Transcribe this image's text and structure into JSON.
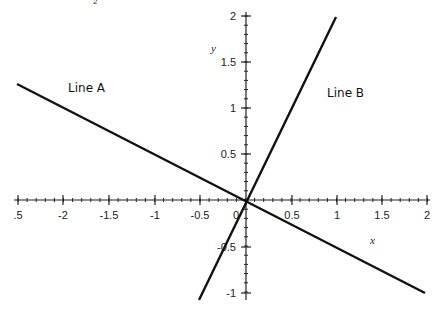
{
  "chart_data": {
    "type": "line",
    "title": "",
    "xlabel": "x",
    "ylabel": "y",
    "xlim": [
      -2.5,
      2
    ],
    "ylim": [
      -1,
      2
    ],
    "x_ticks": [
      "-2.5",
      "-2",
      "-1.5",
      "-1",
      "-0.5",
      "0",
      "0.5",
      "1",
      "1.5",
      "2"
    ],
    "y_ticks": [
      "-1",
      "-0.5",
      "0.5",
      "1",
      "1.5",
      "2"
    ],
    "grid": false,
    "legend": "none",
    "series": [
      {
        "name": "Line A",
        "equation": "y = -0.5x",
        "x": [
          -2.5,
          2
        ],
        "y": [
          1.25,
          -1
        ]
      },
      {
        "name": "Line B",
        "equation": "y = 2x",
        "x": [
          -0.5,
          1
        ],
        "y": [
          -1,
          2
        ]
      }
    ],
    "annotations": [
      "Line A",
      "Line B"
    ]
  },
  "labels": {
    "top_fragment": "2",
    "x_axis": "x",
    "y_axis": "y",
    "line_a": "Line A",
    "line_b": "Line B"
  },
  "ticks": {
    "x": [
      {
        "label": ".5",
        "px": 18
      },
      {
        "label": "-2",
        "px": 63
      },
      {
        "label": "-1.5",
        "px": 109
      },
      {
        "label": "-1",
        "px": 155
      },
      {
        "label": "-0.5",
        "px": 200
      },
      {
        "label": "0",
        "px": 236
      },
      {
        "label": "0.5",
        "px": 292
      },
      {
        "label": "1",
        "px": 337
      },
      {
        "label": "1.5",
        "px": 382
      },
      {
        "label": "2",
        "px": 427
      }
    ],
    "y": [
      {
        "label": "2",
        "py": 16
      },
      {
        "label": "1.5",
        "py": 62
      },
      {
        "label": "1",
        "py": 108
      },
      {
        "label": "0.5",
        "py": 154
      },
      {
        "label": "-0.5",
        "py": 247
      },
      {
        "label": "-1",
        "py": 293
      }
    ]
  }
}
